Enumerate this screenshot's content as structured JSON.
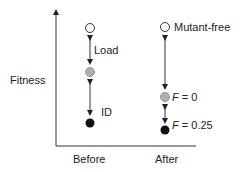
{
  "axes": {
    "ylabel": "Fitness",
    "xlabels": [
      "Before",
      "After"
    ]
  },
  "before": {
    "arrow1_label": "Load",
    "arrow2_label": "ID"
  },
  "after": {
    "top_label": "Mutant-free",
    "mid_label_var": "F",
    "mid_label_val": " = 0",
    "bottom_label_var": "F",
    "bottom_label_val": " = 0.25"
  },
  "colors": {
    "white_point": "#ffffff",
    "gray_point": "#b0b0b0",
    "black_point": "#111111",
    "line": "#333333"
  }
}
